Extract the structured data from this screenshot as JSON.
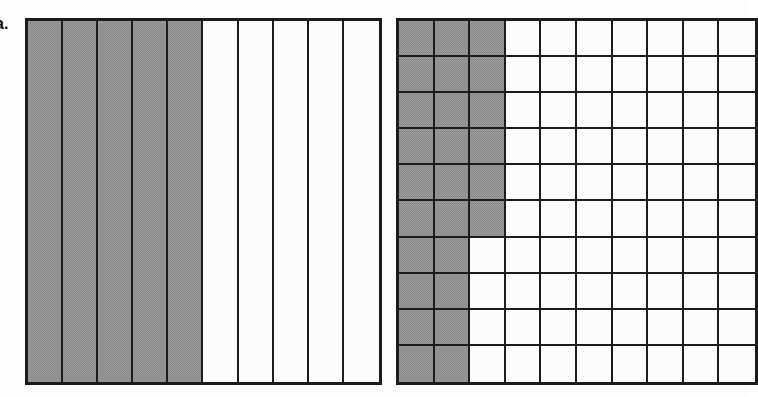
{
  "label": "a.",
  "colors": {
    "shaded": "#9a9a9a",
    "unshaded": "#fcfcfc",
    "line": "#1c1c1c",
    "background": "#fdfdfd"
  },
  "chart_data": [
    {
      "type": "bar",
      "name": "strip-model",
      "title": "",
      "subtitle": "",
      "xlabel": "",
      "ylabel": "",
      "orientation": "vertical-strips",
      "rows": 1,
      "columns": 10,
      "total_parts": 10,
      "shaded_parts": 5,
      "fraction": "5/10",
      "decimal": 0.5,
      "percent": 50,
      "categories": [
        "1",
        "2",
        "3",
        "4",
        "5",
        "6",
        "7",
        "8",
        "9",
        "10"
      ],
      "values": [
        1,
        1,
        1,
        1,
        1,
        0,
        0,
        0,
        0,
        0
      ],
      "shaded_cells": [
        true,
        true,
        true,
        true,
        true,
        false,
        false,
        false,
        false,
        false
      ],
      "legend": [],
      "grid": true,
      "annotations": []
    },
    {
      "type": "heatmap",
      "name": "hundred-grid",
      "title": "",
      "subtitle": "",
      "xlabel": "",
      "ylabel": "",
      "rows": 10,
      "columns": 10,
      "total_parts": 100,
      "shaded_parts": 26,
      "fraction": "26/100",
      "decimal": 0.26,
      "percent": 26,
      "shaded_per_row": [
        3,
        3,
        3,
        3,
        3,
        3,
        2,
        2,
        2,
        2
      ],
      "cells": [
        [
          1,
          1,
          1,
          0,
          0,
          0,
          0,
          0,
          0,
          0
        ],
        [
          1,
          1,
          1,
          0,
          0,
          0,
          0,
          0,
          0,
          0
        ],
        [
          1,
          1,
          1,
          0,
          0,
          0,
          0,
          0,
          0,
          0
        ],
        [
          1,
          1,
          1,
          0,
          0,
          0,
          0,
          0,
          0,
          0
        ],
        [
          1,
          1,
          1,
          0,
          0,
          0,
          0,
          0,
          0,
          0
        ],
        [
          1,
          1,
          1,
          0,
          0,
          0,
          0,
          0,
          0,
          0
        ],
        [
          1,
          1,
          0,
          0,
          0,
          0,
          0,
          0,
          0,
          0
        ],
        [
          1,
          1,
          0,
          0,
          0,
          0,
          0,
          0,
          0,
          0
        ],
        [
          1,
          1,
          0,
          0,
          0,
          0,
          0,
          0,
          0,
          0
        ],
        [
          1,
          1,
          0,
          0,
          0,
          0,
          0,
          0,
          0,
          0
        ]
      ],
      "legend": [],
      "grid": true,
      "annotations": []
    }
  ]
}
